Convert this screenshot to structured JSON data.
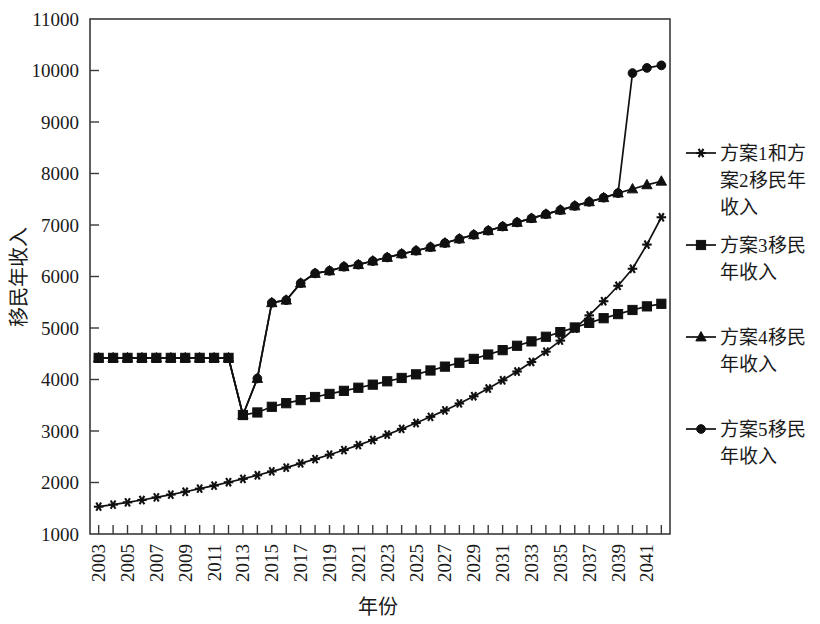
{
  "figure": {
    "background": "#ffffff",
    "ink": "#101010"
  },
  "chart_data": {
    "type": "line",
    "title": "",
    "xlabel": "年份",
    "ylabel": "移民年收入",
    "xlim": [
      2002.4,
      2042.6
    ],
    "ylim": [
      1000,
      11000
    ],
    "ytick_values": [
      1000,
      2000,
      3000,
      4000,
      5000,
      6000,
      7000,
      8000,
      9000,
      10000,
      11000
    ],
    "ytick_labels": [
      "1000",
      "2000",
      "3000",
      "4000",
      "5000",
      "6000",
      "7000",
      "8000",
      "9000",
      "10000",
      "11000"
    ],
    "xtick_values": [
      2003,
      2005,
      2007,
      2009,
      2011,
      2013,
      2015,
      2017,
      2019,
      2021,
      2023,
      2025,
      2027,
      2029,
      2031,
      2033,
      2035,
      2037,
      2039,
      2041
    ],
    "xtick_labels": [
      "2003",
      "2005",
      "2007",
      "2009",
      "2011",
      "2013",
      "2015",
      "2017",
      "2019",
      "2021",
      "2023",
      "2025",
      "2027",
      "2029",
      "2031",
      "2033",
      "2035",
      "2037",
      "2039",
      "2041"
    ],
    "minor_xticks": [
      2004,
      2006,
      2008,
      2010,
      2012,
      2014,
      2016,
      2018,
      2020,
      2022,
      2024,
      2026,
      2028,
      2030,
      2032,
      2034,
      2036,
      2038,
      2040,
      2042
    ],
    "grid": false,
    "legend_position": "right",
    "x": [
      2003,
      2004,
      2005,
      2006,
      2007,
      2008,
      2009,
      2010,
      2011,
      2012,
      2013,
      2014,
      2015,
      2016,
      2017,
      2018,
      2019,
      2020,
      2021,
      2022,
      2023,
      2024,
      2025,
      2026,
      2027,
      2028,
      2029,
      2030,
      2031,
      2032,
      2033,
      2034,
      2035,
      2036,
      2037,
      2038,
      2039,
      2040,
      2041,
      2042
    ],
    "series": [
      {
        "name": "方案1和方案2移民年收入",
        "marker": "asterisk",
        "color": "#101010",
        "values": [
          1530,
          1570,
          1615,
          1660,
          1710,
          1765,
          1820,
          1880,
          1940,
          2005,
          2070,
          2140,
          2215,
          2290,
          2370,
          2455,
          2540,
          2630,
          2725,
          2825,
          2930,
          3040,
          3155,
          3275,
          3400,
          3535,
          3675,
          3825,
          3985,
          4155,
          4340,
          4540,
          4755,
          4990,
          5245,
          5520,
          5820,
          6150,
          6620,
          7150
        ]
      },
      {
        "name": "方案3移民年收入",
        "marker": "square",
        "color": "#101010",
        "values": [
          4420,
          4420,
          4420,
          4420,
          4420,
          4420,
          4420,
          4420,
          4420,
          4420,
          3310,
          3360,
          3470,
          3540,
          3600,
          3660,
          3720,
          3780,
          3840,
          3900,
          3965,
          4030,
          4100,
          4175,
          4250,
          4325,
          4400,
          4485,
          4570,
          4655,
          4740,
          4830,
          4920,
          5010,
          5100,
          5190,
          5270,
          5350,
          5420,
          5470
        ]
      },
      {
        "name": "方案4移民年收入",
        "marker": "triangle",
        "color": "#101010",
        "values": [
          4420,
          4420,
          4420,
          4420,
          4420,
          4420,
          4420,
          4420,
          4420,
          4420,
          3310,
          4020,
          5490,
          5540,
          5870,
          6060,
          6110,
          6190,
          6230,
          6300,
          6370,
          6440,
          6500,
          6570,
          6650,
          6730,
          6810,
          6890,
          6970,
          7050,
          7130,
          7210,
          7290,
          7370,
          7450,
          7530,
          7620,
          7700,
          7780,
          7850
        ]
      },
      {
        "name": "方案5移民年收入",
        "marker": "circle",
        "color": "#101010",
        "values": [
          4420,
          4420,
          4420,
          4420,
          4420,
          4420,
          4420,
          4420,
          4420,
          4420,
          3310,
          4020,
          5490,
          5540,
          5870,
          6060,
          6110,
          6190,
          6230,
          6300,
          6370,
          6440,
          6500,
          6570,
          6650,
          6730,
          6810,
          6890,
          6970,
          7050,
          7130,
          7210,
          7290,
          7370,
          7450,
          7530,
          7620,
          9950,
          10050,
          10100
        ]
      }
    ]
  },
  "legend": {
    "entries": [
      {
        "label": "方案1和方案2移民年收入",
        "marker": "asterisk"
      },
      {
        "label": "方案3移民年收入",
        "marker": "square"
      },
      {
        "label": "方案4移民年收入",
        "marker": "triangle"
      },
      {
        "label": "方案5移民年收入",
        "marker": "circle"
      }
    ]
  }
}
